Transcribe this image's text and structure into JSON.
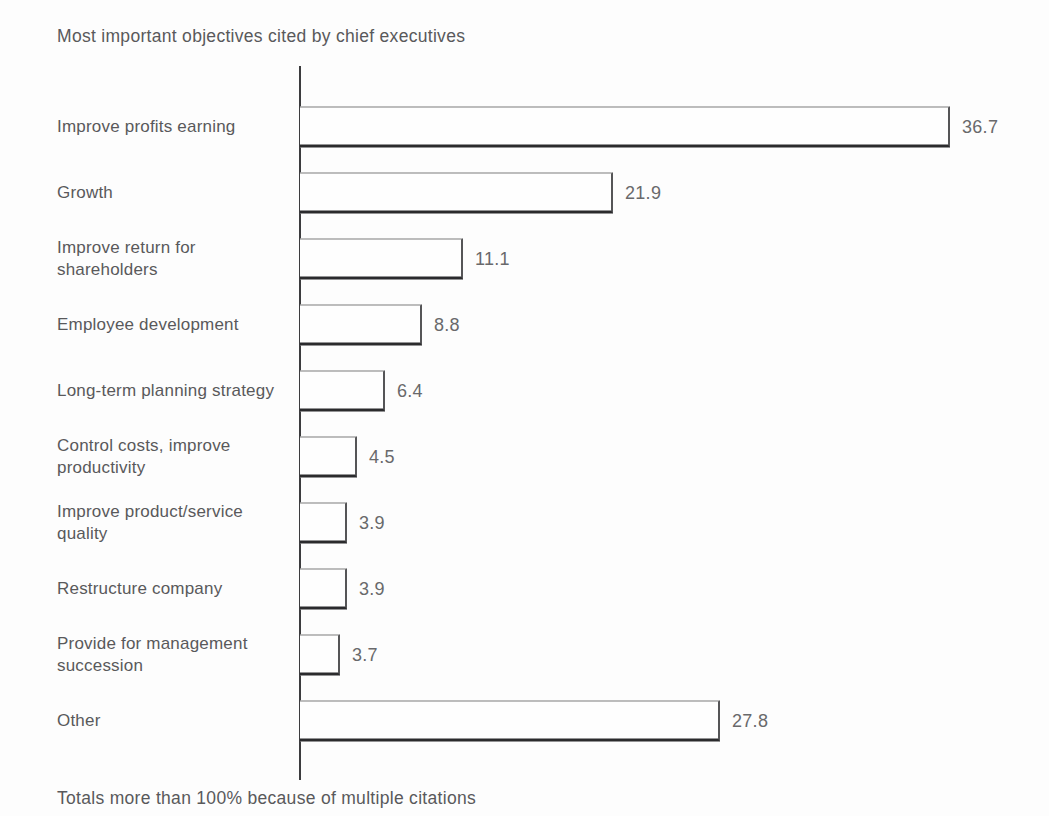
{
  "chart_data": {
    "type": "bar",
    "orientation": "horizontal",
    "title": "Most important objectives cited by chief executives",
    "footnote": "Totals more than 100% because of multiple citations",
    "categories": [
      "Improve profits earning",
      "Growth",
      "Improve return for shareholders",
      "Employee development",
      "Long-term planning strategy",
      "Control costs, improve productivity",
      "Improve product/service quality",
      "Restructure company",
      "Provide for management succession",
      "Other"
    ],
    "values": [
      36.7,
      21.9,
      11.1,
      8.8,
      6.4,
      4.5,
      3.9,
      3.9,
      3.7,
      27.8
    ],
    "value_labels": [
      "36.7",
      "21.9",
      "11.1",
      "8.8",
      "6.4",
      "4.5",
      "3.9",
      "3.9",
      "3.7",
      "27.8"
    ],
    "xlabel": "",
    "ylabel": "",
    "grid": "off",
    "legend": "none",
    "bar_fill_color": "#fefefe",
    "bar_outline_color": "#2b2b2d",
    "text_color": "#59595b",
    "layout": {
      "axis_x_px": 300,
      "bar_height_px": 41,
      "row_pitch_px": 66,
      "bar_widths_px": [
        650,
        313,
        163,
        122,
        85,
        57,
        47,
        47,
        40,
        420
      ]
    }
  }
}
